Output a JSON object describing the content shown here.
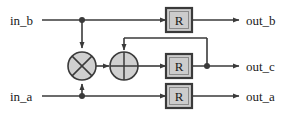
{
  "diagram": {
    "background_color": "#ffffff",
    "line_color": "#3a3a3a",
    "gate_fill_color": "#d0d0d0",
    "register_fill_color": "#cccccc",
    "text_color": "#1a1a1a",
    "inputs": [
      {
        "id": "in_b",
        "label": "in_b",
        "x": 10,
        "y": 20
      },
      {
        "id": "in_a",
        "label": "in_a",
        "x": 10,
        "y": 96
      }
    ],
    "outputs": [
      {
        "id": "out_b",
        "label": "out_b",
        "x": 244,
        "y": 20
      },
      {
        "id": "out_c",
        "label": "out_c",
        "x": 244,
        "y": 66
      },
      {
        "id": "out_a",
        "label": "out_a",
        "x": 244,
        "y": 96
      }
    ],
    "gates": [
      {
        "id": "multiplier",
        "symbol": "multiply",
        "glyph": "⊗",
        "cx": 82,
        "cy": 66,
        "r": 14
      },
      {
        "id": "adder",
        "symbol": "add",
        "glyph": "⊕",
        "cx": 124,
        "cy": 66,
        "r": 14
      }
    ],
    "registers": [
      {
        "id": "reg_b",
        "label": "R",
        "x": 166,
        "y": 8,
        "width": 26,
        "height": 24
      },
      {
        "id": "reg_c",
        "label": "R",
        "x": 166,
        "y": 54,
        "width": 26,
        "height": 24
      },
      {
        "id": "reg_a",
        "label": "R",
        "x": 166,
        "y": 84,
        "width": 26,
        "height": 24
      }
    ],
    "junctions": [
      {
        "id": "junction-in-b",
        "cx": 82,
        "cy": 20,
        "r": 3
      },
      {
        "id": "junction-in-a",
        "cx": 82,
        "cy": 96,
        "r": 3
      },
      {
        "id": "junction-out-c",
        "cx": 207,
        "cy": 66,
        "r": 3
      }
    ],
    "feedback": {
      "id": "feedback-path",
      "from_x": 207,
      "from_y": 66,
      "top_y": 38,
      "to_x": 124,
      "to_y": 52
    }
  }
}
